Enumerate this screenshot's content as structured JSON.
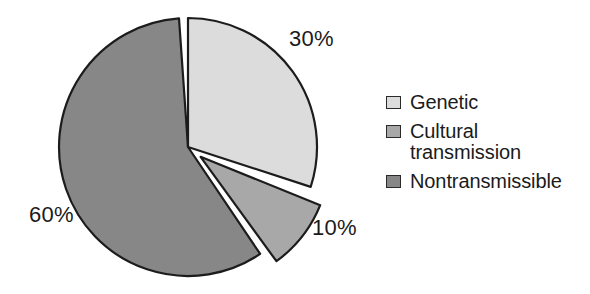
{
  "chart_data": {
    "type": "pie",
    "title": "",
    "categories": [
      "Genetic",
      "Cultural transmission",
      "Nontransmissible"
    ],
    "values": [
      30,
      10,
      60
    ],
    "value_labels": [
      "30%",
      "10%",
      "60%"
    ],
    "unit": "%",
    "total": 100,
    "colors": [
      "#dcdcdc",
      "#a8a8a8",
      "#878787"
    ],
    "slice_outline_color": "#1c1c1c",
    "background": "#ffffff",
    "legend_position": "right",
    "exploded_slices": [
      "Cultural transmission"
    ],
    "start_angle_deg": 0,
    "direction": "clockwise",
    "slices": [
      {
        "name": "Genetic",
        "value": 30,
        "label": "30%",
        "color": "#dcdcdc",
        "start_deg": 0,
        "end_deg": 108,
        "exploded": false
      },
      {
        "name": "Cultural transmission",
        "value": 10,
        "label": "10%",
        "color": "#a8a8a8",
        "start_deg": 112,
        "end_deg": 144,
        "exploded": true
      },
      {
        "name": "Nontransmissible",
        "value": 60,
        "label": "60%",
        "color": "#878787",
        "start_deg": 146,
        "end_deg": 356,
        "exploded": false
      }
    ]
  },
  "labels": {
    "genetic_pct": "30%",
    "cultural_pct": "10%",
    "nontransmissible_pct": "60%"
  },
  "legend": {
    "items": [
      {
        "label": "Genetic",
        "label_line2": "",
        "color": "#dcdcdc"
      },
      {
        "label": "Cultural",
        "label_line2": "transmission",
        "color": "#a8a8a8"
      },
      {
        "label": "Nontransmissible",
        "label_line2": "",
        "color": "#878787"
      }
    ]
  }
}
